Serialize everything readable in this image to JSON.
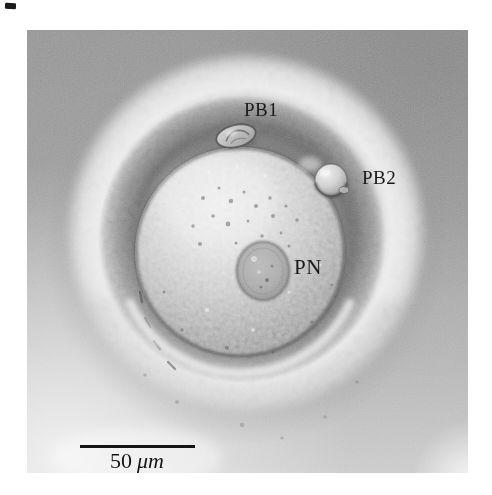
{
  "page": {
    "background": "#ffffff"
  },
  "artifact_mark": {
    "color": "#1b1b1b"
  },
  "micrograph": {
    "alt": "Light micrograph of an oocyte showing zona pellucida halo, first and second polar bodies and a pronucleus",
    "labels": {
      "pb1": "PB1",
      "pb2": "PB2",
      "pn": "PN"
    },
    "scale_bar": {
      "value": "50",
      "unit": "μm",
      "color": "#141414"
    },
    "label_color": "#1a1a1a"
  }
}
